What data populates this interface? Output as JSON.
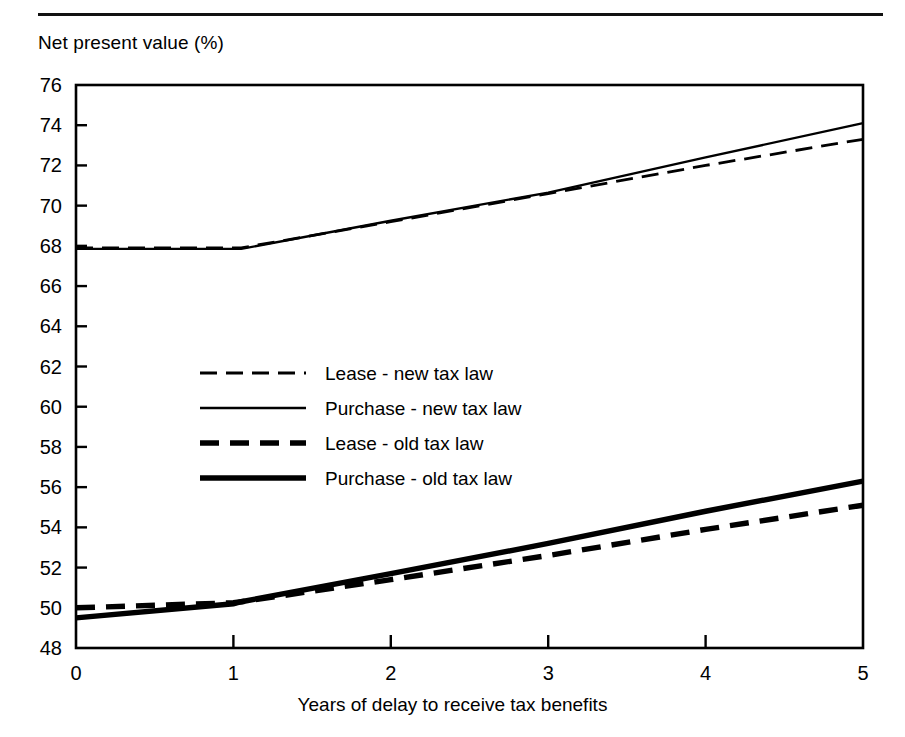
{
  "figure": {
    "y_axis_title": "Net present value (%)",
    "x_axis_title": "Years of delay to receive tax benefits"
  },
  "axes": {
    "y_ticks": [
      "76",
      "74",
      "72",
      "70",
      "68",
      "66",
      "64",
      "62",
      "60",
      "58",
      "56",
      "54",
      "52",
      "50",
      "48"
    ],
    "x_ticks": [
      "0",
      "1",
      "2",
      "3",
      "4",
      "5"
    ]
  },
  "legend": {
    "items": [
      {
        "label": "Lease - new tax law",
        "style": "thin-dashed"
      },
      {
        "label": "Purchase - new tax law",
        "style": "thin-solid"
      },
      {
        "label": "Lease - old tax law",
        "style": "thick-dashed"
      },
      {
        "label": "Purchase - old tax law",
        "style": "thick-solid"
      }
    ]
  },
  "chart_data": {
    "type": "line",
    "title": "",
    "xlabel": "Years of delay to receive tax benefits",
    "ylabel": "Net present value (%)",
    "xlim": [
      0,
      5
    ],
    "ylim": [
      48,
      76
    ],
    "ytick_step": 2,
    "xtick_step": 1,
    "grid": false,
    "legend_position": "center-left-inside",
    "x": [
      0,
      1,
      1.05,
      2,
      3,
      4,
      5
    ],
    "series": [
      {
        "name": "Lease - new tax law",
        "style": "thin-dashed",
        "color": "#000000",
        "values": [
          67.9,
          67.9,
          67.9,
          69.2,
          70.6,
          72.0,
          73.3
        ]
      },
      {
        "name": "Purchase - new tax law",
        "style": "thin-solid",
        "color": "#000000",
        "values": [
          67.85,
          67.85,
          67.85,
          69.25,
          70.65,
          72.4,
          74.1
        ]
      },
      {
        "name": "Lease - old tax law",
        "style": "thick-dashed",
        "color": "#000000",
        "values": [
          50.0,
          50.25,
          50.3,
          51.4,
          52.6,
          53.9,
          55.1
        ]
      },
      {
        "name": "Purchase - old tax law",
        "style": "thick-solid",
        "color": "#000000",
        "values": [
          49.5,
          50.2,
          50.3,
          51.7,
          53.2,
          54.8,
          56.3
        ]
      }
    ]
  },
  "colors": {
    "ink": "#000000",
    "background": "#ffffff"
  }
}
